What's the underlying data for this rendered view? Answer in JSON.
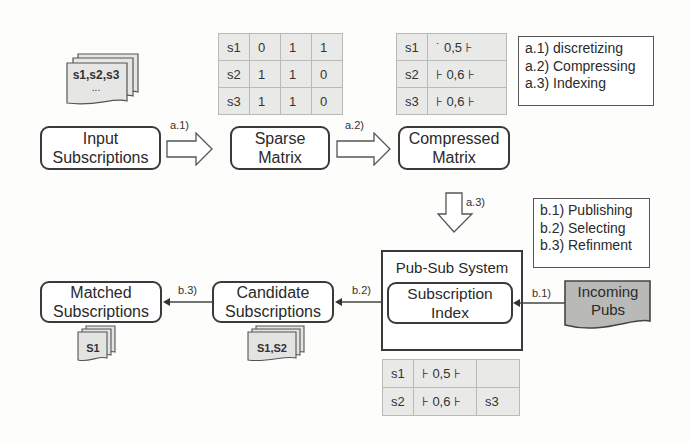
{
  "pipeline_a": {
    "input_docs": {
      "label": "s1,s2,s3",
      "ellipsis": "..."
    },
    "input_box": "Input\nSubscriptions",
    "sparse_box": "Sparse\nMatrix",
    "compressed_box": "Compressed\nMatrix",
    "arrow_a1": "a.1)",
    "arrow_a2": "a.2)",
    "arrow_a3": "a.3)",
    "sparse_matrix": [
      [
        "s1",
        "0",
        "1",
        "1"
      ],
      [
        "s2",
        "1",
        "1",
        "0"
      ],
      [
        "s3",
        "1",
        "1",
        "0"
      ]
    ],
    "compressed_matrix": [
      [
        "s1",
        "˙ 0,5 ⊦"
      ],
      [
        "s2",
        "⊦ 0,6 ⊦"
      ],
      [
        "s3",
        "⊦ 0,6 ⊦"
      ]
    ]
  },
  "legend_a": {
    "items": [
      "a.1) discretizing",
      "a.2) Compressing",
      "a.3) Indexing"
    ]
  },
  "legend_b": {
    "items": [
      "b.1) Publishing",
      "b.2) Selecting",
      "b.3) Refinment"
    ]
  },
  "pipeline_b": {
    "pubsub_title": "Pub-Sub System",
    "index_box": "Subscription\nIndex",
    "incoming": "Incoming\nPubs",
    "candidate_box": "Candidate\nSubscriptions",
    "matched_box": "Matched\nSubscriptions",
    "arrow_b1": "b.1)",
    "arrow_b2": "b.2)",
    "arrow_b3": "b.3)",
    "candidate_docs": "S1,S2",
    "matched_docs": "S1",
    "index_matrix": [
      [
        "s1",
        "⊦ 0,5 ⊦",
        ""
      ],
      [
        "s2",
        "⊦ 0,6 ⊦",
        "s3"
      ]
    ]
  }
}
